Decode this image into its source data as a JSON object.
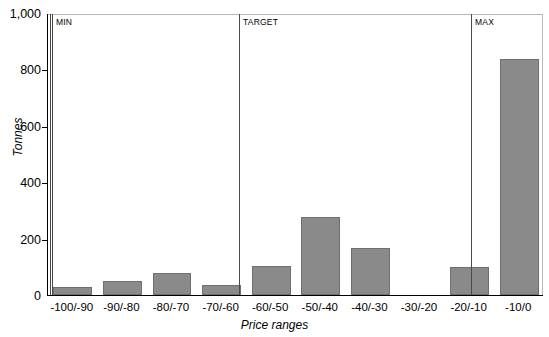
{
  "chart_data": {
    "type": "bar",
    "title": "",
    "xlabel": "Price ranges",
    "ylabel": "Tonnes",
    "categories": [
      "-100/-90",
      "-90/-80",
      "-80/-70",
      "-70/-60",
      "-60/-50",
      "-50/-40",
      "-40/-30",
      "-30/-20",
      "-20/-10",
      "-10/0"
    ],
    "values": [
      30,
      48,
      78,
      37,
      102,
      275,
      165,
      0,
      100,
      838
    ],
    "ylim": [
      0,
      1000
    ],
    "yticks": [
      0,
      200,
      400,
      600,
      800,
      1000
    ],
    "ytick_labels": [
      "0",
      "200",
      "400",
      "600",
      "800",
      "1,000"
    ],
    "grid": false,
    "legend": null,
    "bar_color": "#8a8a8a",
    "bar_edge_color": "#6f6f6f",
    "annotations": [
      {
        "label": "MIN",
        "at_category_boundary": 0,
        "x_px": 49
      },
      {
        "label": "TARGET",
        "at_category_boundary": 4,
        "x_px": 238
      },
      {
        "label": "MAX",
        "at_category_boundary": 9,
        "x_px": 470
      }
    ]
  }
}
